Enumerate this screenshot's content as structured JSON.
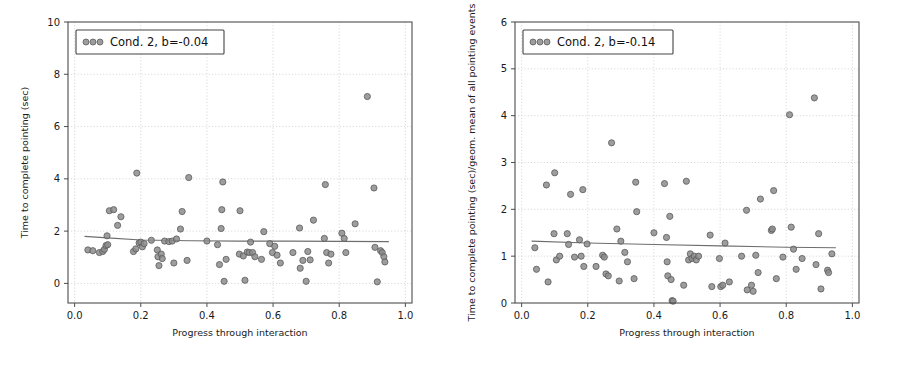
{
  "figure": {
    "background": "#ffffff",
    "marker_color": "#8c8c8c",
    "marker_edge_color": "#5a5a5a",
    "line_color": "#6e6e6e",
    "grid_color": "#c8c8c8",
    "axis_color": "#4d4d4d"
  },
  "chart_data": [
    {
      "type": "scatter",
      "title": "",
      "xlabel": "Progress through interaction",
      "ylabel": "Time to complete pointing (sec)",
      "xlim": [
        -0.02,
        1.02
      ],
      "ylim": [
        -0.75,
        10.0
      ],
      "xticks": [
        0.0,
        0.2,
        0.4,
        0.6,
        0.8,
        1.0
      ],
      "xticklabels": [
        "0.0",
        "0.2",
        "0.4",
        "0.6",
        "0.8",
        "1.0"
      ],
      "yticks": [
        0,
        2,
        4,
        6,
        8,
        10
      ],
      "yticklabels": [
        "0",
        "2",
        "4",
        "6",
        "8",
        "10"
      ],
      "grid": true,
      "legend": {
        "entries": [
          "Cond. 2, b=-0.04"
        ],
        "position": "upper left",
        "marker_count": 3
      },
      "trend": {
        "slope": -0.04,
        "x": [
          0.03,
          0.1,
          0.2,
          0.35,
          0.5,
          0.65,
          0.8,
          0.95
        ],
        "y": [
          1.8,
          1.74,
          1.66,
          1.63,
          1.62,
          1.62,
          1.61,
          1.6
        ]
      },
      "points": [
        {
          "x": 0.04,
          "y": 1.28
        },
        {
          "x": 0.055,
          "y": 1.25
        },
        {
          "x": 0.075,
          "y": 1.18
        },
        {
          "x": 0.085,
          "y": 1.22
        },
        {
          "x": 0.09,
          "y": 1.3
        },
        {
          "x": 0.095,
          "y": 1.45
        },
        {
          "x": 0.098,
          "y": 1.82
        },
        {
          "x": 0.1,
          "y": 1.48
        },
        {
          "x": 0.105,
          "y": 2.78
        },
        {
          "x": 0.118,
          "y": 2.82
        },
        {
          "x": 0.13,
          "y": 2.22
        },
        {
          "x": 0.14,
          "y": 2.55
        },
        {
          "x": 0.178,
          "y": 1.22
        },
        {
          "x": 0.185,
          "y": 1.32
        },
        {
          "x": 0.188,
          "y": 4.22
        },
        {
          "x": 0.195,
          "y": 1.55
        },
        {
          "x": 0.2,
          "y": 1.58
        },
        {
          "x": 0.205,
          "y": 1.4
        },
        {
          "x": 0.21,
          "y": 1.52
        },
        {
          "x": 0.232,
          "y": 1.65
        },
        {
          "x": 0.25,
          "y": 1.28
        },
        {
          "x": 0.252,
          "y": 1.02
        },
        {
          "x": 0.255,
          "y": 0.68
        },
        {
          "x": 0.262,
          "y": 1.12
        },
        {
          "x": 0.265,
          "y": 0.95
        },
        {
          "x": 0.272,
          "y": 1.62
        },
        {
          "x": 0.285,
          "y": 1.6
        },
        {
          "x": 0.295,
          "y": 1.62
        },
        {
          "x": 0.3,
          "y": 0.78
        },
        {
          "x": 0.308,
          "y": 1.7
        },
        {
          "x": 0.32,
          "y": 2.08
        },
        {
          "x": 0.325,
          "y": 2.75
        },
        {
          "x": 0.34,
          "y": 0.88
        },
        {
          "x": 0.345,
          "y": 4.05
        },
        {
          "x": 0.4,
          "y": 1.62
        },
        {
          "x": 0.432,
          "y": 1.48
        },
        {
          "x": 0.438,
          "y": 0.72
        },
        {
          "x": 0.443,
          "y": 2.1
        },
        {
          "x": 0.445,
          "y": 2.82
        },
        {
          "x": 0.448,
          "y": 3.88
        },
        {
          "x": 0.452,
          "y": 0.08
        },
        {
          "x": 0.458,
          "y": 0.92
        },
        {
          "x": 0.498,
          "y": 1.12
        },
        {
          "x": 0.5,
          "y": 2.78
        },
        {
          "x": 0.51,
          "y": 1.05
        },
        {
          "x": 0.515,
          "y": 0.12
        },
        {
          "x": 0.522,
          "y": 1.2
        },
        {
          "x": 0.528,
          "y": 1.18
        },
        {
          "x": 0.532,
          "y": 1.58
        },
        {
          "x": 0.538,
          "y": 1.18
        },
        {
          "x": 0.545,
          "y": 1.02
        },
        {
          "x": 0.565,
          "y": 0.92
        },
        {
          "x": 0.572,
          "y": 1.98
        },
        {
          "x": 0.59,
          "y": 1.52
        },
        {
          "x": 0.598,
          "y": 1.18
        },
        {
          "x": 0.605,
          "y": 1.42
        },
        {
          "x": 0.612,
          "y": 1.08
        },
        {
          "x": 0.622,
          "y": 0.78
        },
        {
          "x": 0.66,
          "y": 1.18
        },
        {
          "x": 0.68,
          "y": 2.12
        },
        {
          "x": 0.682,
          "y": 0.58
        },
        {
          "x": 0.69,
          "y": 0.88
        },
        {
          "x": 0.7,
          "y": 0.08
        },
        {
          "x": 0.705,
          "y": 1.22
        },
        {
          "x": 0.712,
          "y": 0.9
        },
        {
          "x": 0.722,
          "y": 2.42
        },
        {
          "x": 0.755,
          "y": 1.72
        },
        {
          "x": 0.758,
          "y": 3.78
        },
        {
          "x": 0.762,
          "y": 1.18
        },
        {
          "x": 0.768,
          "y": 0.78
        },
        {
          "x": 0.775,
          "y": 1.12
        },
        {
          "x": 0.808,
          "y": 1.92
        },
        {
          "x": 0.815,
          "y": 1.72
        },
        {
          "x": 0.82,
          "y": 1.18
        },
        {
          "x": 0.848,
          "y": 2.28
        },
        {
          "x": 0.885,
          "y": 7.15
        },
        {
          "x": 0.905,
          "y": 3.65
        },
        {
          "x": 0.908,
          "y": 1.38
        },
        {
          "x": 0.915,
          "y": 0.06
        },
        {
          "x": 0.925,
          "y": 1.25
        },
        {
          "x": 0.93,
          "y": 1.18
        },
        {
          "x": 0.935,
          "y": 1.02
        },
        {
          "x": 0.938,
          "y": 0.82
        }
      ]
    },
    {
      "type": "scatter",
      "title": "",
      "xlabel": "Progress through interaction",
      "ylabel": "Time to complete pointing (sec)/geom. mean of all pointing events",
      "xlim": [
        -0.02,
        1.02
      ],
      "ylim": [
        0.0,
        6.0
      ],
      "xticks": [
        0.0,
        0.2,
        0.4,
        0.6,
        0.8,
        1.0
      ],
      "xticklabels": [
        "0.0",
        "0.2",
        "0.4",
        "0.6",
        "0.8",
        "1.0"
      ],
      "yticks": [
        0,
        1,
        2,
        3,
        4,
        5,
        6
      ],
      "yticklabels": [
        "0",
        "1",
        "2",
        "3",
        "4",
        "5",
        "6"
      ],
      "grid": true,
      "legend": {
        "entries": [
          "Cond. 2, b=-0.14"
        ],
        "position": "upper left",
        "marker_count": 3
      },
      "trend": {
        "slope": -0.14,
        "x": [
          0.03,
          0.2,
          0.4,
          0.6,
          0.8,
          0.95
        ],
        "y": [
          1.32,
          1.28,
          1.25,
          1.22,
          1.19,
          1.18
        ]
      },
      "points": [
        {
          "x": 0.04,
          "y": 1.18
        },
        {
          "x": 0.045,
          "y": 0.72
        },
        {
          "x": 0.075,
          "y": 2.52
        },
        {
          "x": 0.08,
          "y": 0.45
        },
        {
          "x": 0.098,
          "y": 1.48
        },
        {
          "x": 0.1,
          "y": 2.78
        },
        {
          "x": 0.105,
          "y": 0.92
        },
        {
          "x": 0.115,
          "y": 1.0
        },
        {
          "x": 0.138,
          "y": 1.48
        },
        {
          "x": 0.142,
          "y": 1.25
        },
        {
          "x": 0.148,
          "y": 2.32
        },
        {
          "x": 0.16,
          "y": 0.98
        },
        {
          "x": 0.175,
          "y": 1.35
        },
        {
          "x": 0.18,
          "y": 1.0
        },
        {
          "x": 0.185,
          "y": 2.42
        },
        {
          "x": 0.188,
          "y": 0.78
        },
        {
          "x": 0.198,
          "y": 1.26
        },
        {
          "x": 0.225,
          "y": 0.78
        },
        {
          "x": 0.245,
          "y": 1.02
        },
        {
          "x": 0.25,
          "y": 0.98
        },
        {
          "x": 0.255,
          "y": 0.62
        },
        {
          "x": 0.262,
          "y": 0.58
        },
        {
          "x": 0.272,
          "y": 3.42
        },
        {
          "x": 0.288,
          "y": 1.58
        },
        {
          "x": 0.295,
          "y": 0.47
        },
        {
          "x": 0.3,
          "y": 1.32
        },
        {
          "x": 0.312,
          "y": 1.08
        },
        {
          "x": 0.32,
          "y": 0.88
        },
        {
          "x": 0.34,
          "y": 0.52
        },
        {
          "x": 0.345,
          "y": 2.58
        },
        {
          "x": 0.348,
          "y": 1.95
        },
        {
          "x": 0.4,
          "y": 1.5
        },
        {
          "x": 0.432,
          "y": 2.55
        },
        {
          "x": 0.438,
          "y": 1.4
        },
        {
          "x": 0.44,
          "y": 0.88
        },
        {
          "x": 0.442,
          "y": 0.58
        },
        {
          "x": 0.448,
          "y": 1.85
        },
        {
          "x": 0.452,
          "y": 0.5
        },
        {
          "x": 0.455,
          "y": 0.05
        },
        {
          "x": 0.458,
          "y": 0.04
        },
        {
          "x": 0.49,
          "y": 0.38
        },
        {
          "x": 0.498,
          "y": 2.6
        },
        {
          "x": 0.505,
          "y": 0.92
        },
        {
          "x": 0.51,
          "y": 1.05
        },
        {
          "x": 0.515,
          "y": 0.95
        },
        {
          "x": 0.522,
          "y": 1.0
        },
        {
          "x": 0.528,
          "y": 0.92
        },
        {
          "x": 0.535,
          "y": 1.0
        },
        {
          "x": 0.57,
          "y": 1.45
        },
        {
          "x": 0.575,
          "y": 0.35
        },
        {
          "x": 0.598,
          "y": 0.95
        },
        {
          "x": 0.602,
          "y": 0.35
        },
        {
          "x": 0.608,
          "y": 0.38
        },
        {
          "x": 0.615,
          "y": 1.28
        },
        {
          "x": 0.628,
          "y": 0.45
        },
        {
          "x": 0.665,
          "y": 1.0
        },
        {
          "x": 0.68,
          "y": 1.98
        },
        {
          "x": 0.682,
          "y": 0.28
        },
        {
          "x": 0.695,
          "y": 0.38
        },
        {
          "x": 0.7,
          "y": 0.25
        },
        {
          "x": 0.708,
          "y": 1.02
        },
        {
          "x": 0.715,
          "y": 0.65
        },
        {
          "x": 0.722,
          "y": 2.22
        },
        {
          "x": 0.755,
          "y": 1.55
        },
        {
          "x": 0.758,
          "y": 1.58
        },
        {
          "x": 0.762,
          "y": 2.4
        },
        {
          "x": 0.77,
          "y": 0.52
        },
        {
          "x": 0.79,
          "y": 0.98
        },
        {
          "x": 0.81,
          "y": 4.02
        },
        {
          "x": 0.815,
          "y": 1.62
        },
        {
          "x": 0.822,
          "y": 1.15
        },
        {
          "x": 0.83,
          "y": 0.72
        },
        {
          "x": 0.848,
          "y": 0.95
        },
        {
          "x": 0.885,
          "y": 4.38
        },
        {
          "x": 0.89,
          "y": 0.82
        },
        {
          "x": 0.898,
          "y": 1.48
        },
        {
          "x": 0.905,
          "y": 0.3
        },
        {
          "x": 0.925,
          "y": 0.7
        },
        {
          "x": 0.928,
          "y": 0.65
        },
        {
          "x": 0.938,
          "y": 1.05
        }
      ]
    }
  ]
}
